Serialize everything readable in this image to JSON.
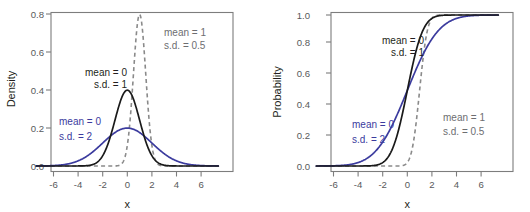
{
  "figure": {
    "title": "",
    "background": "#ffffff",
    "colors": {
      "black_curve": "#1a1a1a",
      "blue_curve": "#3b3b9e",
      "dashed_curve": "#8a8a8a",
      "axis": "#7d7d7d",
      "tick_text": "#58595b",
      "axis_title": "#231f20"
    }
  },
  "panels": [
    {
      "id": "density",
      "name": "normal-density-plot",
      "chart_type": "line",
      "ylabel": "Density",
      "xlabel": "x",
      "xticks": [
        "-6",
        "-4",
        "-2",
        "0",
        "2",
        "4",
        "6"
      ],
      "yticks": [
        "0.0",
        "0.2",
        "0.4",
        "0.6",
        "0.8"
      ],
      "annotations": [
        {
          "name": "annotation-mean0-sd1",
          "line1": "mean = 0",
          "line2": "s.d. = 1",
          "color": "black"
        },
        {
          "name": "annotation-mean0-sd2",
          "line1": "mean = 0",
          "line2": "s.d. = 2",
          "color": "blue"
        },
        {
          "name": "annotation-mean1-sd05",
          "line1": "mean = 1",
          "line2": "s.d. = 0.5",
          "color": "gray"
        }
      ]
    },
    {
      "id": "probability",
      "name": "normal-cdf-plot",
      "chart_type": "line",
      "ylabel": "Probability",
      "xlabel": "x",
      "xticks": [
        "-6",
        "-4",
        "-2",
        "0",
        "2",
        "4",
        "6"
      ],
      "yticks": [
        "0.0",
        "0.2",
        "0.4",
        "0.6",
        "0.8",
        "1.0"
      ],
      "annotations": [
        {
          "name": "annotation-mean0-sd1",
          "line1": "mean = 0",
          "line2": "s.d. = 1",
          "color": "black"
        },
        {
          "name": "annotation-mean0-sd2",
          "line1": "mean = 0",
          "line2": "s.d. = 2",
          "color": "blue"
        },
        {
          "name": "annotation-mean1-sd05",
          "line1": "mean = 1",
          "line2": "s.d. = 0.5",
          "color": "gray"
        }
      ]
    }
  ],
  "chart_data": [
    {
      "type": "line",
      "id": "density",
      "title": "",
      "xlabel": "x",
      "ylabel": "Density",
      "xlim": [
        -7.4,
        7.4
      ],
      "ylim": [
        -0.02,
        0.87
      ],
      "xticks": [
        -6,
        -4,
        -2,
        0,
        2,
        4,
        6
      ],
      "yticks": [
        0.0,
        0.2,
        0.4,
        0.6,
        0.8
      ],
      "grid": false,
      "legend": "inline-annotations",
      "series": [
        {
          "name": "mean = 0, s.d. = 1",
          "style": "solid",
          "color": "#1a1a1a",
          "distribution": "normal_pdf",
          "mean": 0,
          "sd": 1,
          "peak": 0.399
        },
        {
          "name": "mean = 0, s.d. = 2",
          "style": "solid",
          "color": "#3b3b9e",
          "distribution": "normal_pdf",
          "mean": 0,
          "sd": 2,
          "peak": 0.199
        },
        {
          "name": "mean = 1, s.d. = 0.5",
          "style": "dashed",
          "color": "#8a8a8a",
          "distribution": "normal_pdf",
          "mean": 1,
          "sd": 0.5,
          "peak": 0.798
        }
      ]
    },
    {
      "type": "line",
      "id": "probability",
      "title": "",
      "xlabel": "x",
      "ylabel": "Probability",
      "xlim": [
        -7.4,
        7.4
      ],
      "ylim": [
        -0.025,
        1.06
      ],
      "xticks": [
        -6,
        -4,
        -2,
        0,
        2,
        4,
        6
      ],
      "yticks": [
        0.0,
        0.2,
        0.4,
        0.6,
        0.8,
        1.0
      ],
      "grid": false,
      "legend": "inline-annotations",
      "series": [
        {
          "name": "mean = 0, s.d. = 1",
          "style": "solid",
          "color": "#1a1a1a",
          "distribution": "normal_cdf",
          "mean": 0,
          "sd": 1
        },
        {
          "name": "mean = 0, s.d. = 2",
          "style": "solid",
          "color": "#3b3b9e",
          "distribution": "normal_cdf",
          "mean": 0,
          "sd": 2
        },
        {
          "name": "mean = 1, s.d. = 0.5",
          "style": "dashed",
          "color": "#8a8a8a",
          "distribution": "normal_cdf",
          "mean": 1,
          "sd": 0.5
        }
      ]
    }
  ]
}
